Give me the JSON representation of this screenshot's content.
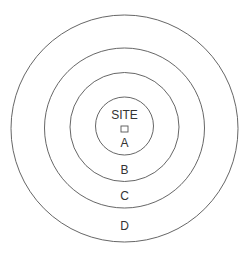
{
  "diagram": {
    "type": "concentric-zones",
    "center": {
      "x": 124.5,
      "y": 128.5
    },
    "site_label": "SITE",
    "zones": [
      {
        "label": "A",
        "radius": 29,
        "label_y": 144
      },
      {
        "label": "B",
        "radius": 54.5,
        "label_y": 171
      },
      {
        "label": "C",
        "radius": 80,
        "label_y": 197
      },
      {
        "label": "D",
        "radius": 113.5,
        "label_y": 227
      }
    ],
    "colors": {
      "stroke": "#555555",
      "text": "#333333",
      "background": "#ffffff"
    }
  }
}
